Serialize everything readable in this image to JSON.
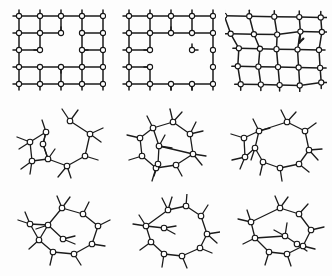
{
  "figure": {
    "title": "",
    "background_color": "#fdfdfd",
    "bond_color": "#1b1b1b",
    "atom_fill": "#ffffff",
    "atom_stroke": "#141414",
    "rows": 3,
    "columns": 3,
    "width": 332,
    "height": 276
  },
  "panels": [
    {
      "id": "panel-1",
      "name": "crystalline-lattice-vacancy",
      "row": 1,
      "column": 1,
      "x": 8,
      "y": 6,
      "w": 98,
      "h": 86,
      "type": "square-lattice",
      "cols": 5,
      "rows": 5,
      "cell_w": 21,
      "cell_h": 17,
      "origin_x": 11,
      "origin_y": 10,
      "missing_nodes": [
        [
          2,
          2
        ]
      ],
      "missing_edges": [
        [
          "h",
          2,
          1
        ],
        [
          "h",
          2,
          2
        ],
        [
          "v",
          1,
          2
        ],
        [
          "v",
          2,
          2
        ],
        [
          "h",
          1,
          2
        ],
        [
          "v",
          2,
          1
        ]
      ],
      "stub_len": 6,
      "atom_r": 2.6,
      "bond_w": 1.5
    },
    {
      "id": "panel-2",
      "name": "crystalline-lattice-void",
      "row": 1,
      "column": 2,
      "x": 118,
      "y": 6,
      "w": 98,
      "h": 86,
      "type": "square-lattice",
      "cols": 5,
      "rows": 5,
      "cell_w": 21,
      "cell_h": 17,
      "origin_x": 11,
      "origin_y": 10,
      "missing_nodes": [
        [
          2,
          2
        ],
        [
          2,
          3
        ],
        [
          3,
          3
        ]
      ],
      "missing_edges": [
        [
          "h",
          2,
          1
        ],
        [
          "h",
          2,
          2
        ],
        [
          "h",
          2,
          3
        ],
        [
          "v",
          1,
          2
        ],
        [
          "v",
          2,
          2
        ],
        [
          "v",
          1,
          3
        ],
        [
          "v",
          2,
          3
        ],
        [
          "h",
          3,
          2
        ],
        [
          "h",
          3,
          3
        ],
        [
          "v",
          2,
          1
        ],
        [
          "v",
          3,
          2
        ]
      ],
      "stub_len": 6,
      "atom_r": 2.6,
      "bond_w": 1.5
    },
    {
      "id": "panel-3",
      "name": "distorted-lattice-dislocation",
      "row": 1,
      "column": 3,
      "x": 225,
      "y": 6,
      "w": 102,
      "h": 86,
      "type": "distorted-lattice",
      "cols": 5,
      "rows": 5,
      "cell_w": 21,
      "cell_h": 17,
      "origin_x": 11,
      "origin_y": 10,
      "dislocation": true,
      "dislocation_at": [
        1,
        1
      ],
      "stub_len": 6,
      "atom_r": 2.6,
      "bond_w": 1.5
    },
    {
      "id": "panel-4",
      "name": "amorphous-ring-cluster-a",
      "row": 2,
      "column": 1,
      "x": 8,
      "y": 104,
      "w": 102,
      "h": 82,
      "type": "amorphous-ring",
      "atom_r": 2.8,
      "bond_w": 1.3,
      "ring": [
        [
          62,
          17
        ],
        [
          82,
          30
        ],
        [
          77,
          52
        ],
        [
          59,
          62
        ],
        [
          40,
          55
        ],
        [
          35,
          40
        ]
      ],
      "inner": [
        [
          38,
          28
        ],
        [
          22,
          38
        ],
        [
          24,
          57
        ],
        [
          40,
          55
        ]
      ],
      "nodes": [
        [
          62,
          17
        ],
        [
          82,
          30
        ],
        [
          77,
          52
        ],
        [
          59,
          62
        ],
        [
          40,
          55
        ],
        [
          35,
          40
        ],
        [
          38,
          28
        ],
        [
          22,
          38
        ],
        [
          24,
          57
        ]
      ],
      "edges": [
        [
          0,
          1
        ],
        [
          1,
          2
        ],
        [
          2,
          3
        ],
        [
          3,
          4
        ],
        [
          4,
          5
        ],
        [
          5,
          6
        ],
        [
          6,
          7
        ],
        [
          7,
          8
        ],
        [
          8,
          4
        ],
        [
          5,
          4
        ]
      ],
      "dangling": [
        [
          0,
          -8,
          -12
        ],
        [
          0,
          8,
          -11
        ],
        [
          1,
          13,
          -6
        ],
        [
          1,
          11,
          8
        ],
        [
          2,
          13,
          4
        ],
        [
          3,
          4,
          12
        ],
        [
          3,
          -9,
          11
        ],
        [
          4,
          7,
          -10
        ],
        [
          5,
          3,
          -12
        ],
        [
          6,
          -4,
          -12
        ],
        [
          7,
          -13,
          -5
        ],
        [
          7,
          -11,
          7
        ],
        [
          8,
          -11,
          8
        ],
        [
          8,
          -2,
          13
        ]
      ]
    },
    {
      "id": "panel-5",
      "name": "amorphous-ring-cluster-b",
      "row": 2,
      "column": 2,
      "x": 118,
      "y": 104,
      "w": 102,
      "h": 82,
      "type": "amorphous-ring",
      "atom_r": 2.8,
      "bond_w": 1.3,
      "nodes": [
        [
          35,
          24
        ],
        [
          55,
          18
        ],
        [
          72,
          30
        ],
        [
          75,
          50
        ],
        [
          58,
          61
        ],
        [
          38,
          64
        ],
        [
          24,
          52
        ],
        [
          22,
          34
        ],
        [
          41,
          42
        ],
        [
          40,
          60
        ]
      ],
      "edges": [
        [
          0,
          1
        ],
        [
          1,
          2
        ],
        [
          2,
          3
        ],
        [
          3,
          4
        ],
        [
          4,
          5
        ],
        [
          5,
          6
        ],
        [
          6,
          7
        ],
        [
          7,
          0
        ],
        [
          0,
          8
        ],
        [
          8,
          9
        ],
        [
          9,
          5
        ],
        [
          8,
          3
        ]
      ],
      "dangling": [
        [
          0,
          -6,
          -12
        ],
        [
          1,
          -3,
          -13
        ],
        [
          1,
          9,
          -10
        ],
        [
          2,
          6,
          -12
        ],
        [
          2,
          13,
          -3
        ],
        [
          3,
          13,
          2
        ],
        [
          3,
          9,
          11
        ],
        [
          4,
          6,
          11
        ],
        [
          5,
          -4,
          13
        ],
        [
          6,
          -13,
          4
        ],
        [
          7,
          -13,
          -3
        ],
        [
          8,
          6,
          -11
        ],
        [
          8,
          13,
          2
        ],
        [
          9,
          -4,
          12
        ]
      ]
    },
    {
      "id": "panel-6",
      "name": "amorphous-ring-cluster-c",
      "row": 2,
      "column": 3,
      "x": 225,
      "y": 104,
      "w": 102,
      "h": 82,
      "type": "amorphous-ring",
      "atom_r": 2.8,
      "bond_w": 1.3,
      "nodes": [
        [
          62,
          18
        ],
        [
          80,
          27
        ],
        [
          84,
          46
        ],
        [
          74,
          60
        ],
        [
          55,
          64
        ],
        [
          38,
          58
        ],
        [
          30,
          44
        ],
        [
          34,
          27
        ],
        [
          19,
          34
        ],
        [
          20,
          53
        ]
      ],
      "edges": [
        [
          0,
          1
        ],
        [
          1,
          2
        ],
        [
          2,
          3
        ],
        [
          3,
          4
        ],
        [
          4,
          5
        ],
        [
          5,
          6
        ],
        [
          6,
          7
        ],
        [
          7,
          0
        ],
        [
          7,
          8
        ],
        [
          8,
          9
        ],
        [
          9,
          6
        ]
      ],
      "dangling": [
        [
          0,
          -6,
          -12
        ],
        [
          0,
          9,
          -10
        ],
        [
          1,
          11,
          -8
        ],
        [
          2,
          13,
          -1
        ],
        [
          2,
          9,
          10
        ],
        [
          3,
          10,
          8
        ],
        [
          4,
          2,
          13
        ],
        [
          5,
          -3,
          13
        ],
        [
          6,
          -4,
          12
        ],
        [
          7,
          -6,
          -12
        ],
        [
          7,
          11,
          -3
        ],
        [
          8,
          -13,
          -4
        ],
        [
          9,
          -13,
          3
        ],
        [
          9,
          -5,
          12
        ]
      ]
    },
    {
      "id": "panel-7",
      "name": "amorphous-ring-cluster-d",
      "row": 3,
      "column": 1,
      "x": 8,
      "y": 194,
      "w": 104,
      "h": 78,
      "type": "amorphous-ring",
      "atom_r": 2.8,
      "bond_w": 1.3,
      "nodes": [
        [
          54,
          14
        ],
        [
          75,
          20
        ],
        [
          90,
          32
        ],
        [
          84,
          50
        ],
        [
          66,
          60
        ],
        [
          45,
          58
        ],
        [
          31,
          46
        ],
        [
          22,
          30
        ],
        [
          40,
          31
        ],
        [
          55,
          45
        ]
      ],
      "edges": [
        [
          0,
          1
        ],
        [
          1,
          2
        ],
        [
          2,
          3
        ],
        [
          3,
          4
        ],
        [
          4,
          5
        ],
        [
          5,
          6
        ],
        [
          6,
          7
        ],
        [
          7,
          8
        ],
        [
          8,
          0
        ],
        [
          8,
          6
        ],
        [
          8,
          9
        ]
      ],
      "dangling": [
        [
          0,
          -5,
          -12
        ],
        [
          0,
          8,
          -11
        ],
        [
          1,
          6,
          -12
        ],
        [
          2,
          12,
          -6
        ],
        [
          3,
          13,
          2
        ],
        [
          4,
          7,
          11
        ],
        [
          5,
          -3,
          13
        ],
        [
          6,
          -10,
          9
        ],
        [
          7,
          -12,
          -4
        ],
        [
          7,
          -5,
          -12
        ],
        [
          8,
          -12,
          4
        ],
        [
          9,
          12,
          -3
        ],
        [
          9,
          12,
          5
        ]
      ]
    },
    {
      "id": "panel-8",
      "name": "amorphous-ring-cluster-e",
      "row": 3,
      "column": 2,
      "x": 118,
      "y": 194,
      "w": 102,
      "h": 78,
      "type": "amorphous-ring",
      "atom_r": 2.8,
      "bond_w": 1.3,
      "nodes": [
        [
          50,
          16
        ],
        [
          68,
          12
        ],
        [
          83,
          22
        ],
        [
          89,
          40
        ],
        [
          82,
          54
        ],
        [
          64,
          62
        ],
        [
          46,
          60
        ],
        [
          33,
          48
        ],
        [
          28,
          32
        ],
        [
          46,
          34
        ]
      ],
      "edges": [
        [
          0,
          1
        ],
        [
          1,
          2
        ],
        [
          2,
          3
        ],
        [
          3,
          4
        ],
        [
          4,
          5
        ],
        [
          5,
          6
        ],
        [
          6,
          7
        ],
        [
          7,
          8
        ],
        [
          8,
          0
        ],
        [
          8,
          9
        ]
      ],
      "dangling": [
        [
          0,
          -6,
          -12
        ],
        [
          0,
          4,
          -13
        ],
        [
          1,
          1,
          -13
        ],
        [
          2,
          7,
          -11
        ],
        [
          3,
          13,
          -2
        ],
        [
          3,
          10,
          9
        ],
        [
          4,
          12,
          5
        ],
        [
          5,
          5,
          12
        ],
        [
          6,
          -2,
          13
        ],
        [
          7,
          -11,
          8
        ],
        [
          8,
          -13,
          -2
        ],
        [
          8,
          -7,
          -11
        ],
        [
          9,
          12,
          -2
        ],
        [
          9,
          11,
          6
        ]
      ]
    },
    {
      "id": "panel-9",
      "name": "amorphous-ring-cluster-f",
      "row": 3,
      "column": 3,
      "x": 225,
      "y": 194,
      "w": 102,
      "h": 78,
      "type": "amorphous-ring",
      "atom_r": 2.8,
      "bond_w": 1.3,
      "nodes": [
        [
          55,
          14
        ],
        [
          74,
          20
        ],
        [
          86,
          36
        ],
        [
          78,
          52
        ],
        [
          62,
          60
        ],
        [
          44,
          58
        ],
        [
          30,
          44
        ],
        [
          26,
          28
        ],
        [
          60,
          42
        ],
        [
          72,
          50
        ]
      ],
      "edges": [
        [
          0,
          1
        ],
        [
          1,
          2
        ],
        [
          2,
          3
        ],
        [
          3,
          4
        ],
        [
          4,
          5
        ],
        [
          5,
          6
        ],
        [
          6,
          7
        ],
        [
          7,
          0
        ],
        [
          8,
          9
        ],
        [
          8,
          6
        ],
        [
          9,
          3
        ]
      ],
      "dangling": [
        [
          0,
          -5,
          -12
        ],
        [
          0,
          8,
          -11
        ],
        [
          1,
          9,
          -10
        ],
        [
          2,
          13,
          -3
        ],
        [
          3,
          12,
          3
        ],
        [
          4,
          4,
          12
        ],
        [
          5,
          -4,
          13
        ],
        [
          6,
          -12,
          6
        ],
        [
          7,
          -13,
          -3
        ],
        [
          7,
          -4,
          -12
        ],
        [
          8,
          2,
          -13
        ],
        [
          8,
          -11,
          -6
        ],
        [
          9,
          10,
          7
        ]
      ]
    }
  ]
}
